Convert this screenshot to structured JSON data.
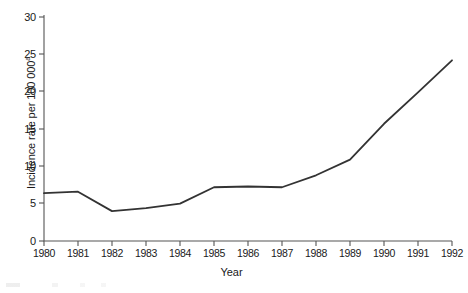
{
  "chart_data": {
    "type": "line",
    "title": "",
    "subtitle": "",
    "xlabel": "Year",
    "ylabel": "Incidence rate per 100 000",
    "ylabel_superscript": "a",
    "categories": [
      "1980",
      "1981",
      "1982",
      "1983",
      "1984",
      "1985",
      "1986",
      "1987",
      "1988",
      "1989",
      "1990",
      "1991",
      "1992"
    ],
    "x": [
      1980,
      1981,
      1982,
      1983,
      1984,
      1985,
      1986,
      1987,
      1988,
      1989,
      1990,
      1991,
      1992
    ],
    "values": [
      6.4,
      6.6,
      4.0,
      4.4,
      5.0,
      7.2,
      7.3,
      7.2,
      8.8,
      10.9,
      15.7,
      19.9,
      24.2
    ],
    "series": [
      {
        "name": "Incidence rate",
        "values": [
          6.4,
          6.6,
          4.0,
          4.4,
          5.0,
          7.2,
          7.3,
          7.2,
          8.8,
          10.9,
          15.7,
          19.9,
          24.2
        ]
      }
    ],
    "xlim": [
      1980,
      1992
    ],
    "ylim": [
      0,
      30
    ],
    "yticks": [
      0,
      5,
      10,
      15,
      20,
      25,
      30
    ],
    "ytick_labels": [
      "0",
      "5",
      "10",
      "15",
      "20",
      "25",
      "30"
    ],
    "xticks": [
      1980,
      1981,
      1982,
      1983,
      1984,
      1985,
      1986,
      1987,
      1988,
      1989,
      1990,
      1991,
      1992
    ],
    "xtick_labels": [
      "1980",
      "1981",
      "1982",
      "1983",
      "1984",
      "1985",
      "1986",
      "1987",
      "1988",
      "1989",
      "1990",
      "1991",
      "1992"
    ],
    "grid": false,
    "legend": false,
    "legend_position": "none",
    "line_color": "#333333",
    "background_color": "#ffffff",
    "axis_color": "#555555",
    "annotations": []
  }
}
